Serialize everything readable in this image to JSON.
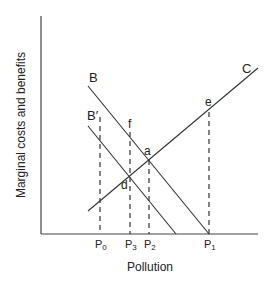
{
  "diagram": {
    "title": "",
    "xlabel": "Pollution",
    "ylabel": "Marginal costs and benefits",
    "curves": [
      {
        "name": "B",
        "label": "B",
        "description": "marginal benefit curve"
      },
      {
        "name": "B_prime",
        "label": "B′",
        "description": "shifted marginal benefit curve"
      },
      {
        "name": "C",
        "label": "C",
        "description": "marginal cost curve"
      }
    ],
    "points": {
      "a": "a",
      "d": "d",
      "e": "e",
      "f": "f"
    },
    "x_ticks": {
      "p0": {
        "main": "P",
        "sub": "0"
      },
      "p3": {
        "main": "P",
        "sub": "3"
      },
      "p2": {
        "main": "P",
        "sub": "2"
      },
      "p1": {
        "main": "P",
        "sub": "1"
      }
    },
    "colors": {
      "line": "#333333",
      "background": "#ffffff"
    }
  }
}
